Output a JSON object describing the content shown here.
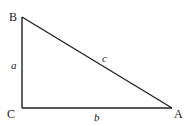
{
  "diagram": {
    "type": "right-triangle",
    "stroke_color": "#1f1f1f",
    "vertices": [
      {
        "name": "B",
        "x": 22,
        "y": 17,
        "label": "B",
        "label_x": 9,
        "label_y": 21
      },
      {
        "name": "C",
        "x": 22,
        "y": 108,
        "label": "C",
        "label_x": 7,
        "label_y": 118
      },
      {
        "name": "A",
        "x": 172,
        "y": 108,
        "label": "A",
        "label_x": 174,
        "label_y": 118
      }
    ],
    "sides": [
      {
        "name": "a",
        "from": "C",
        "to": "B",
        "label": "a",
        "label_x": 11,
        "label_y": 69
      },
      {
        "name": "b",
        "from": "C",
        "to": "A",
        "label": "b",
        "label_x": 94,
        "label_y": 121
      },
      {
        "name": "c",
        "from": "B",
        "to": "A",
        "label": "c",
        "label_x": 102,
        "label_y": 62
      }
    ],
    "right_angle_at": "C"
  }
}
